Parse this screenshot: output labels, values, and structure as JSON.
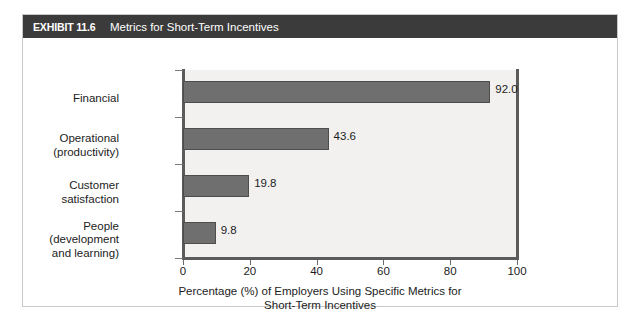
{
  "exhibit": {
    "number": "EXHIBIT 11.6",
    "title": "Metrics for Short-Term Incentives"
  },
  "colors": {
    "header_bar": "#3b3b3b",
    "header_text": "#ffffff",
    "bar_fill": "#6f6f6f",
    "bar_stroke": "#4d4d4d",
    "plot_background": "#f2f1f0",
    "axis_line": "#5b5b5b",
    "frame_border": "#c9c9c9",
    "text": "#1c1c1c"
  },
  "chart_data": {
    "type": "bar",
    "orientation": "horizontal",
    "title": "Metrics for Short-Term Incentives",
    "categories": [
      "Financial",
      "Operational\n(productivity)",
      "Customer\nsatisfaction",
      "People\n(development\nand learning)"
    ],
    "values": [
      92.0,
      43.6,
      19.8,
      9.8
    ],
    "value_labels": [
      "92.0",
      "43.6",
      "19.8",
      "9.8"
    ],
    "xlabel": "Percentage (%) of Employers Using Specific Metrics for Short-Term Incentives",
    "xlabel_line1": "Percentage (%) of Employers Using Specific Metrics for",
    "xlabel_line2": "Short-Term Incentives",
    "ylabel": "",
    "xlim": [
      0,
      100
    ],
    "xticks": [
      0,
      20,
      40,
      60,
      80,
      100
    ],
    "xtick_labels": [
      "0",
      "20",
      "40",
      "60",
      "80",
      "100"
    ],
    "grid": false,
    "legend": false
  }
}
